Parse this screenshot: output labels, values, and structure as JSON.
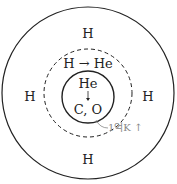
{
  "diagram": {
    "outer_shell": {
      "labels": [
        "H",
        "H",
        "H",
        "H"
      ]
    },
    "fusion_shell": {
      "label": "H → He"
    },
    "core": {
      "top_label": "He",
      "arrow": "↓",
      "bottom_label": "C, O"
    },
    "annotation": {
      "label": "1억K ↑"
    },
    "colors": {
      "line": "#222222",
      "annotation": "#888888"
    }
  }
}
